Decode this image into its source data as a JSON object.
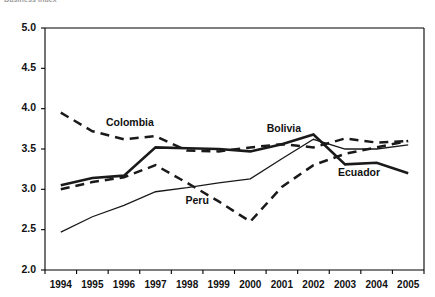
{
  "page": {
    "clipped_header_text": "Business Index",
    "background_color": "#ffffff",
    "ink_color": "#1a1a1a"
  },
  "chart_data": {
    "type": "line",
    "title": "",
    "xlabel": "",
    "ylabel": "",
    "categories": [
      "1994",
      "1995",
      "1996",
      "1997",
      "1998",
      "1999",
      "2000",
      "2001",
      "2002",
      "2003",
      "2004",
      "2005"
    ],
    "ylim": [
      2.0,
      5.0
    ],
    "ytick_labels": [
      "2.0",
      "2.5",
      "3.0",
      "3.5",
      "4.0",
      "4.5",
      "5.0"
    ],
    "ytick_values": [
      2.0,
      2.5,
      3.0,
      3.5,
      4.0,
      4.5,
      5.0
    ],
    "grid": false,
    "legend": "inline-labels",
    "series": [
      {
        "name": "Colombia",
        "style": "dashed",
        "label_x_year": "1996",
        "values": [
          3.95,
          3.72,
          3.62,
          3.66,
          3.48,
          3.47,
          3.52,
          3.56,
          3.52,
          3.63,
          3.58,
          3.6
        ]
      },
      {
        "name": "Bolivia",
        "style": "solid-thick",
        "label_x_year": "2001",
        "values": [
          3.05,
          3.14,
          3.17,
          3.52,
          3.51,
          3.5,
          3.47,
          3.56,
          3.68,
          3.31,
          3.33,
          3.2
        ]
      },
      {
        "name": "Peru",
        "style": "solid-thin",
        "label_x_year": "1998",
        "values": [
          2.47,
          2.66,
          2.8,
          2.97,
          3.02,
          3.08,
          3.13,
          3.38,
          3.62,
          3.5,
          3.5,
          3.55
        ]
      },
      {
        "name": "Ecuador",
        "style": "dashed",
        "label_x_year": "2003",
        "values": [
          3.0,
          3.09,
          3.15,
          3.3,
          3.08,
          2.85,
          2.6,
          3.03,
          3.3,
          3.44,
          3.52,
          3.6
        ]
      }
    ]
  }
}
